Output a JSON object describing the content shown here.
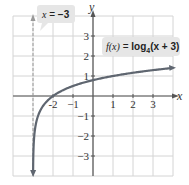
{
  "chart_data": {
    "type": "line",
    "title": "",
    "xlabel": "x",
    "ylabel": "y",
    "xlim": [
      -4,
      4
    ],
    "ylim": [
      -4,
      4
    ],
    "grid": true,
    "x_ticks": [
      {
        "value": -2,
        "label": "-2"
      },
      {
        "value": -1,
        "label": "−1"
      },
      {
        "value": 1,
        "label": "1"
      },
      {
        "value": 2,
        "label": "2"
      },
      {
        "value": 3,
        "label": "3"
      }
    ],
    "y_ticks": [
      {
        "value": 3,
        "label": "3"
      },
      {
        "value": 2,
        "label": "2"
      },
      {
        "value": 1,
        "label": "1"
      },
      {
        "value": -1,
        "label": "−1"
      },
      {
        "value": -2,
        "label": "−2"
      },
      {
        "value": -3,
        "label": "−3"
      }
    ],
    "series": [
      {
        "name": "f(x) = log4(x + 3)",
        "function": "log4(x+3)",
        "x_range": [
          -2.995,
          3.9
        ],
        "points": [
          {
            "x": -2.99,
            "y": -3.32
          },
          {
            "x": -2.9,
            "y": -1.66
          },
          {
            "x": -2.75,
            "y": -1.0
          },
          {
            "x": -2.5,
            "y": -0.5
          },
          {
            "x": -2,
            "y": 0
          },
          {
            "x": -1,
            "y": 0.5
          },
          {
            "x": 1,
            "y": 1
          },
          {
            "x": 3,
            "y": 1.29
          },
          {
            "x": 3.9,
            "y": 1.39
          }
        ],
        "color": "#5f6670"
      }
    ],
    "asymptote": {
      "type": "vertical",
      "x": -3,
      "style": "dashed",
      "label": "x = −3"
    },
    "annotations": [
      {
        "text": "x = −3",
        "target": "asymptote"
      },
      {
        "text": "f(x) = log4(x + 3)",
        "target": "curve"
      }
    ]
  },
  "labels": {
    "x_axis": "x",
    "y_axis": "y",
    "asymptote_callout": {
      "var": "x",
      "eq": " = ",
      "val": "−3"
    },
    "function_callout": {
      "fx": "f(x)",
      "eq": " = ",
      "log": "log",
      "base": "4",
      "arg": "(x + 3)"
    }
  },
  "colors": {
    "grid": "#d4d4d4",
    "axis": "#555555",
    "curve": "#5f6670",
    "callout_bg": "#e6e6e6",
    "asymptote": "#999999"
  }
}
